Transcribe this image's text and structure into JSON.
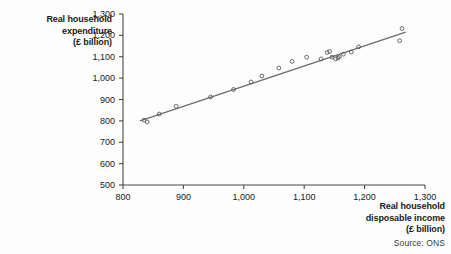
{
  "figure": {
    "source_note": "Source: ONS"
  },
  "chart_data": {
    "type": "scatter",
    "title": "",
    "xlabel": "Real household\ndisposable income\n(£ billion)",
    "ylabel": "Real household\nexpenditure\n(£ billion)",
    "xlim": [
      800,
      1300
    ],
    "ylim": [
      500,
      1300
    ],
    "xticks": [
      800,
      900,
      1000,
      1100,
      1200,
      1300
    ],
    "yticks": [
      500,
      600,
      700,
      800,
      900,
      1000,
      1100,
      1200,
      1300
    ],
    "xtick_labels": [
      "800",
      "900",
      "1,000",
      "1,100",
      "1,200",
      "1,300"
    ],
    "ytick_labels": [
      "500",
      "600",
      "700",
      "800",
      "900",
      "1,000",
      "1,100",
      "1,200",
      "1,300"
    ],
    "grid": false,
    "legend": null,
    "marker": "open-circle",
    "marker_color": "#5a5a5a",
    "line_color": "#6b6b6b",
    "x": [
      835,
      840,
      860,
      888,
      945,
      983,
      1012,
      1030,
      1058,
      1080,
      1104,
      1128,
      1138,
      1142,
      1146,
      1152,
      1156,
      1158,
      1165,
      1178,
      1190,
      1258,
      1262
    ],
    "y": [
      803,
      795,
      832,
      868,
      912,
      947,
      982,
      1010,
      1047,
      1078,
      1098,
      1090,
      1120,
      1125,
      1098,
      1090,
      1094,
      1100,
      1112,
      1122,
      1146,
      1175,
      1232
    ],
    "points": [
      {
        "x": 835,
        "y": 803
      },
      {
        "x": 840,
        "y": 795
      },
      {
        "x": 860,
        "y": 832
      },
      {
        "x": 888,
        "y": 868
      },
      {
        "x": 945,
        "y": 912
      },
      {
        "x": 983,
        "y": 947
      },
      {
        "x": 1012,
        "y": 982
      },
      {
        "x": 1030,
        "y": 1010
      },
      {
        "x": 1058,
        "y": 1047
      },
      {
        "x": 1080,
        "y": 1078
      },
      {
        "x": 1104,
        "y": 1098
      },
      {
        "x": 1128,
        "y": 1090
      },
      {
        "x": 1138,
        "y": 1120
      },
      {
        "x": 1142,
        "y": 1125
      },
      {
        "x": 1146,
        "y": 1098
      },
      {
        "x": 1152,
        "y": 1090
      },
      {
        "x": 1156,
        "y": 1094
      },
      {
        "x": 1158,
        "y": 1100
      },
      {
        "x": 1165,
        "y": 1112
      },
      {
        "x": 1178,
        "y": 1122
      },
      {
        "x": 1190,
        "y": 1146
      },
      {
        "x": 1258,
        "y": 1175
      },
      {
        "x": 1262,
        "y": 1232
      }
    ],
    "trendline": {
      "name": "fitted line",
      "x_start": 828,
      "y_start": 800,
      "x_end": 1268,
      "y_end": 1215
    }
  }
}
